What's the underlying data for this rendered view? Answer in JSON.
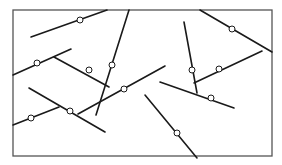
{
  "diagram": {
    "type": "line-segment-network",
    "width": 282,
    "height": 165,
    "stroke_color": "#1a1a1a",
    "frame_color": "#555555",
    "background": "#ffffff",
    "frame": {
      "x": 13,
      "y": 10,
      "w": 259,
      "h": 146
    },
    "segments": [
      {
        "x1": 31,
        "y1": 37,
        "x2": 107,
        "y2": 10
      },
      {
        "x1": 13,
        "y1": 75,
        "x2": 71,
        "y2": 49
      },
      {
        "x1": 54,
        "y1": 57,
        "x2": 109,
        "y2": 87
      },
      {
        "x1": 129,
        "y1": 10,
        "x2": 96,
        "y2": 115
      },
      {
        "x1": 13,
        "y1": 125,
        "x2": 59,
        "y2": 107
      },
      {
        "x1": 29,
        "y1": 88,
        "x2": 105,
        "y2": 132
      },
      {
        "x1": 78,
        "y1": 114,
        "x2": 165,
        "y2": 66
      },
      {
        "x1": 145,
        "y1": 95,
        "x2": 197,
        "y2": 158
      },
      {
        "x1": 184,
        "y1": 22,
        "x2": 197,
        "y2": 93
      },
      {
        "x1": 194,
        "y1": 83,
        "x2": 262,
        "y2": 51
      },
      {
        "x1": 200,
        "y1": 10,
        "x2": 272,
        "y2": 52
      },
      {
        "x1": 160,
        "y1": 82,
        "x2": 234,
        "y2": 108
      }
    ],
    "nodes": [
      {
        "cx": 80,
        "cy": 20
      },
      {
        "cx": 37,
        "cy": 63
      },
      {
        "cx": 89,
        "cy": 70
      },
      {
        "cx": 112,
        "cy": 65
      },
      {
        "cx": 31,
        "cy": 118
      },
      {
        "cx": 70,
        "cy": 111
      },
      {
        "cx": 124,
        "cy": 89
      },
      {
        "cx": 177,
        "cy": 133
      },
      {
        "cx": 192,
        "cy": 70
      },
      {
        "cx": 219,
        "cy": 69
      },
      {
        "cx": 232,
        "cy": 29
      },
      {
        "cx": 211,
        "cy": 98
      }
    ],
    "node_radius": 3
  }
}
